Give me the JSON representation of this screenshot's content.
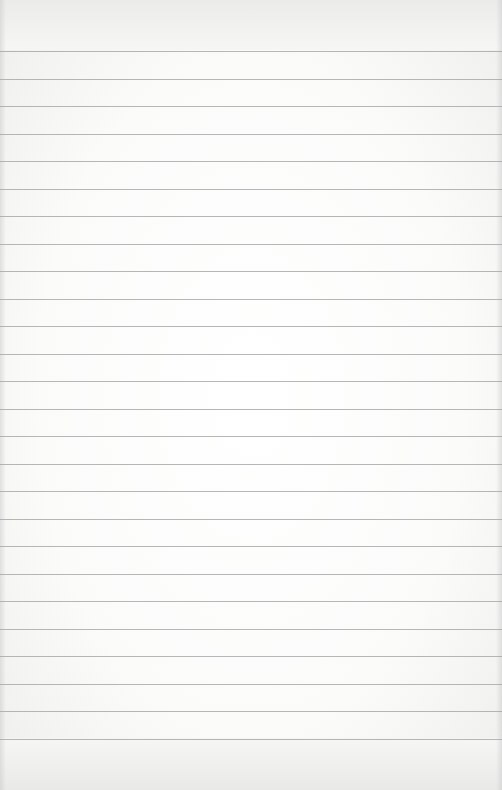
{
  "page": {
    "type": "lined-notebook-paper",
    "background_color": "#f7f7f6",
    "line_color": "#a9a9a9",
    "line_count": 26,
    "first_line_y": 51,
    "line_spacing_px": 27.5,
    "text_content": ""
  }
}
